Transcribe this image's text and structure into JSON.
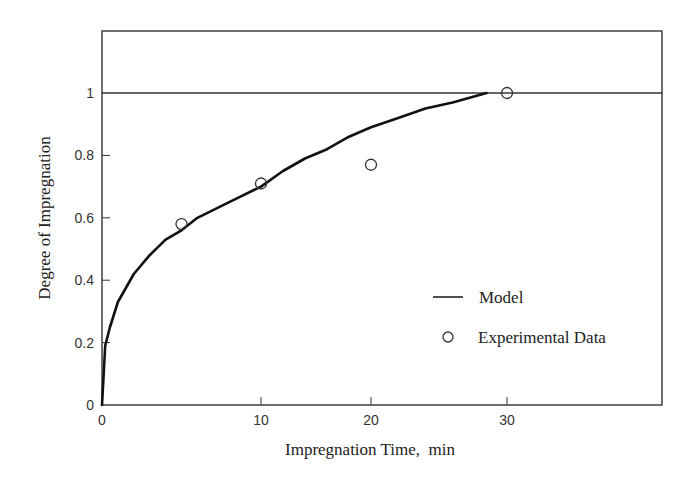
{
  "chart_data": {
    "type": "line",
    "title": "",
    "xlabel": "Impregnation Time,  min",
    "ylabel": "Degree of Impregnation",
    "xlim": [
      0,
      35
    ],
    "ylim": [
      0,
      1.2
    ],
    "x_ticks": [
      0,
      10,
      20,
      30
    ],
    "x_tick_labels": [
      "0",
      "10",
      "20",
      "30"
    ],
    "y_ticks": [
      0,
      0.2,
      0.4,
      0.6,
      0.8,
      1
    ],
    "y_tick_labels": [
      "0",
      "0.2",
      "0.4",
      "0.6",
      "0.8",
      "1"
    ],
    "grid": false,
    "reference_line": {
      "y": 1,
      "label": ""
    },
    "legend_position": "lower right (inside)",
    "series": [
      {
        "name": "Model",
        "style": "line",
        "x": [
          0,
          0.2,
          0.5,
          1,
          2,
          3,
          4,
          5,
          6,
          8,
          10,
          12,
          14,
          16,
          18,
          20,
          22,
          24,
          26,
          28.5
        ],
        "y": [
          0,
          0.19,
          0.25,
          0.33,
          0.42,
          0.48,
          0.53,
          0.56,
          0.6,
          0.65,
          0.7,
          0.75,
          0.79,
          0.82,
          0.86,
          0.89,
          0.92,
          0.95,
          0.97,
          1.0
        ]
      },
      {
        "name": "Experimental Data",
        "style": "open-circle",
        "x": [
          5,
          10,
          20,
          30
        ],
        "y": [
          0.58,
          0.71,
          0.77,
          1.0
        ]
      }
    ]
  },
  "legend": {
    "items": [
      {
        "label": "Model",
        "symbol": "line"
      },
      {
        "label": "Experimental Data",
        "symbol": "open-circle"
      }
    ]
  }
}
